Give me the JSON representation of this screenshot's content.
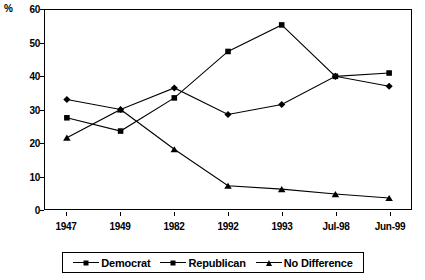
{
  "chart_data": {
    "type": "line",
    "title": "",
    "xlabel": "",
    "ylabel": "%",
    "ylim": [
      0,
      60
    ],
    "ytick_step": 10,
    "yticks": [
      0,
      10,
      20,
      30,
      40,
      50,
      60
    ],
    "grid": false,
    "legend_position": "bottom",
    "categories": [
      "1947",
      "1949",
      "1982",
      "1992",
      "1993",
      "Jul-98",
      "Jun-99"
    ],
    "series": [
      {
        "name": "Democrat",
        "marker": "diamond",
        "values": [
          33,
          30,
          36.5,
          28.5,
          31.5,
          40,
          37
        ]
      },
      {
        "name": "Republican",
        "marker": "square",
        "values": [
          27.5,
          23.5,
          33.5,
          47.5,
          55.5,
          40,
          41
        ]
      },
      {
        "name": "No Difference",
        "marker": "triangle",
        "values": [
          21.5,
          30,
          18,
          7,
          6,
          4.5,
          3.3
        ]
      }
    ],
    "colors": {
      "line": "#000000",
      "axis": "#000000",
      "background": "#ffffff"
    }
  },
  "legend": {
    "entries": [
      {
        "label": "Democrat",
        "marker": "diamond-marker"
      },
      {
        "label": "Republican",
        "marker": "square-marker"
      },
      {
        "label": "No Difference",
        "marker": "triangle-marker"
      }
    ]
  }
}
